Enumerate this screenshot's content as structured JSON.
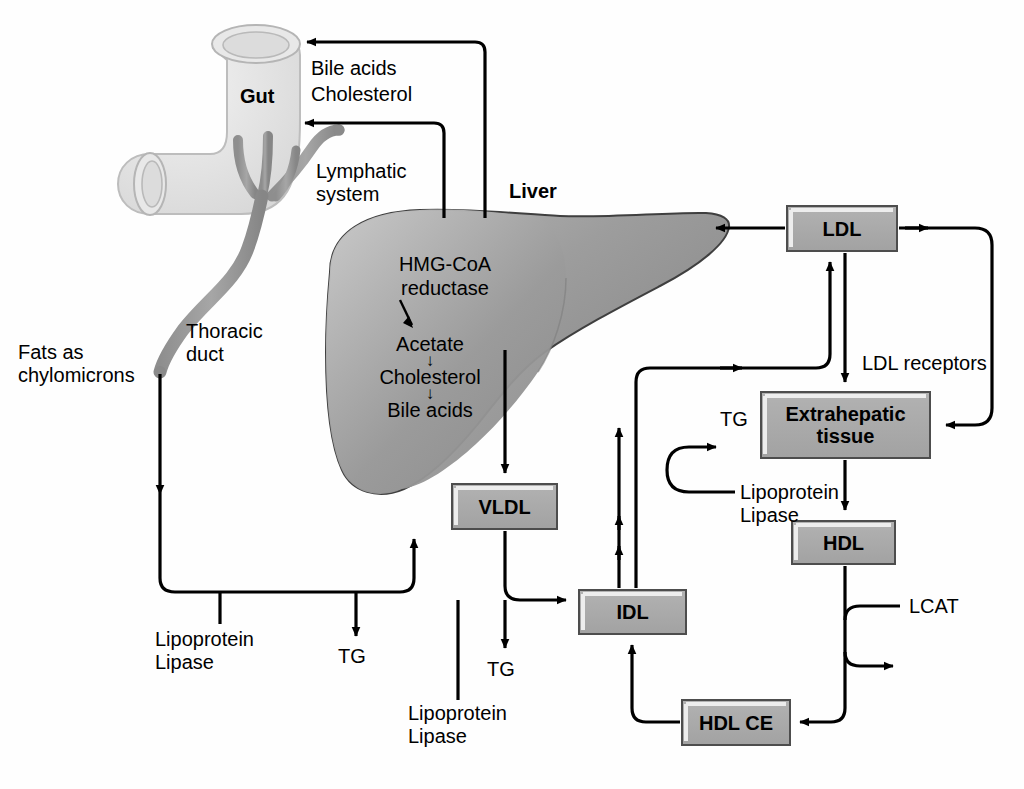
{
  "diagram": {
    "organs": {
      "gut_label": "Gut",
      "liver_label": "Liver"
    },
    "annotations": {
      "bile_acids": "Bile acids",
      "cholesterol_top": "Cholesterol",
      "lymphatic_system": "Lymphatic\nsystem",
      "thoracic_duct": "Thoracic\nduct",
      "fats_as_chylomicrons": "Fats as\nchylomicrons",
      "ldl_receptors": "LDL receptors",
      "lcat": "LCAT",
      "lipoprotein_lipase_left": "Lipoprotein\nLipase",
      "lipoprotein_lipase_mid": "Lipoprotein\nLipase",
      "lipoprotein_lipase_right": "Lipoprotein\nLipase",
      "tg_left": "TG",
      "tg_mid": "TG",
      "tg_right": "TG"
    },
    "liver_pathway": {
      "enzyme": "HMG-CoA\nreductase",
      "steps": [
        "Acetate",
        "Cholesterol",
        "Bile acids"
      ],
      "arrow_glyph": "↓"
    },
    "boxes": [
      {
        "id": "ldl",
        "label": "LDL",
        "x": 787,
        "y": 206,
        "w": 110,
        "h": 45
      },
      {
        "id": "extrahepatic",
        "label": "Extrahepatic\ntissue",
        "x": 761,
        "y": 392,
        "w": 169,
        "h": 66
      },
      {
        "id": "hdl",
        "label": "HDL",
        "x": 792,
        "y": 521,
        "w": 103,
        "h": 43
      },
      {
        "id": "vldl",
        "label": "VLDL",
        "x": 452,
        "y": 484,
        "w": 105,
        "h": 45
      },
      {
        "id": "idl",
        "label": "IDL",
        "x": 579,
        "y": 590,
        "w": 107,
        "h": 44
      },
      {
        "id": "hdlce",
        "label": "HDL CE",
        "x": 682,
        "y": 700,
        "w": 108,
        "h": 45
      }
    ],
    "colors": {
      "box_fill": "#a8a8a8",
      "box_border": "#4d4d4d",
      "box_highlight": "#e8e8e8",
      "stroke": "#000000",
      "gut_fill": "#e3e3e3",
      "lymph_fill": "#9a9a9a",
      "liver_fill": "#989898",
      "background": "#fefefe"
    }
  }
}
